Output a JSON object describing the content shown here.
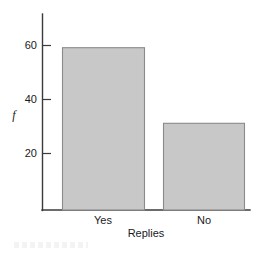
{
  "chart_data": {
    "type": "bar",
    "title": "",
    "subtitle": "",
    "categories": [
      "Yes",
      "No"
    ],
    "values": [
      59,
      31
    ],
    "series": [
      {
        "name": "f",
        "values": [
          59,
          31
        ]
      }
    ],
    "xlabel": "Replies",
    "ylabel": "f",
    "ylim": [
      0,
      68
    ],
    "xlim": [
      0,
      2
    ],
    "y_ticks": [
      20,
      40,
      60
    ],
    "y_tick_labels": [
      "20",
      "40",
      "60"
    ],
    "x_tick_labels": [
      "Yes",
      "No"
    ],
    "grid": false,
    "legend": false,
    "legend_position": "none",
    "annotations": [],
    "bar_fill_color": "#c8c8c8",
    "bar_edge_color": "#8a8a8a",
    "axis_color": "#3a3a3a",
    "background_color": "#ffffff"
  },
  "axis": {
    "y_label": "f",
    "x_label": "Replies",
    "ticks": [
      {
        "label": "60",
        "value": 60
      },
      {
        "label": "40",
        "value": 40
      },
      {
        "label": "20",
        "value": 20
      }
    ]
  },
  "bars": [
    {
      "label": "Yes",
      "value": 59
    },
    {
      "label": "No",
      "value": 31
    }
  ]
}
